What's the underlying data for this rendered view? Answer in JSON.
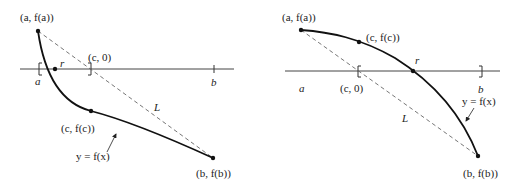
{
  "colors": {
    "curve": "#111111",
    "axis": "#444444",
    "secant": "#666666",
    "text": "#222222",
    "background": "#ffffff"
  },
  "panels": [
    {
      "id": "left",
      "description": "Decreasing convex curve crossing the x-axis near a",
      "labels": {
        "point_a": "(a, f(a))",
        "point_c0": "(c, 0)",
        "root": "r",
        "tick_a": "a",
        "tick_b": "b",
        "secant": "L",
        "point_c": "(c, f(c))",
        "curve": "y = f(x)",
        "point_b": "(b, f(b))"
      }
    },
    {
      "id": "right",
      "description": "Decreasing concave curve crossing the x-axis near b",
      "labels": {
        "point_a": "(a, f(a))",
        "point_c": "(c, f(c))",
        "root": "r",
        "tick_a": "a",
        "point_c0": "(c, 0)",
        "tick_b": "b",
        "curve": "y = f(x)",
        "secant": "L",
        "point_b": "(b, f(b))"
      }
    }
  ]
}
